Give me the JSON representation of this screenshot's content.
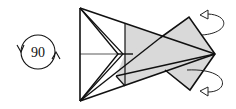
{
  "diagram": {
    "type": "origami-step",
    "rotation_symbol": {
      "label": "90",
      "meaning": "rotate model 90 degrees"
    },
    "fill_color": "#d9d9d9",
    "line_color": "#111111",
    "annotations": [
      {
        "kind": "valley-fold-arrow",
        "position": "upper-right",
        "direction": "fold behind/up"
      },
      {
        "kind": "valley-fold-arrow",
        "position": "lower-right",
        "direction": "fold behind/down"
      }
    ]
  }
}
